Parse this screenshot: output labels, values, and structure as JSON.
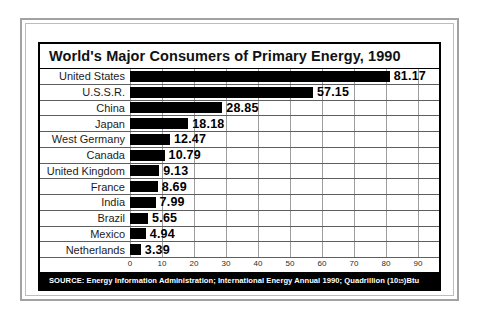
{
  "chart": {
    "title": "World's Major Consumers of Primary Energy, 1990",
    "source_prefix": "SOURCE: Energy Information Administration; International Energy Annual 1990; Quadrillion (10",
    "source_superscript": "15",
    "source_suffix": ")Btu"
  },
  "chart_data": {
    "type": "bar",
    "orientation": "horizontal",
    "title": "World's Major Consumers of Primary Energy, 1990",
    "categories": [
      "United States",
      "U.S.S.R.",
      "China",
      "Japan",
      "West Germany",
      "Canada",
      "United Kingdom",
      "France",
      "India",
      "Brazil",
      "Mexico",
      "Netherlands"
    ],
    "values": [
      81.17,
      57.15,
      28.85,
      18.18,
      12.47,
      10.79,
      9.13,
      8.69,
      7.99,
      5.65,
      4.94,
      3.39
    ],
    "value_labels": [
      "81.17",
      "57.15",
      "28.85",
      "18.18",
      "12.47",
      "10.79",
      "9.13",
      "8.69",
      "7.99",
      "5.65",
      "4.94",
      "3.39"
    ],
    "xlabel": "",
    "ylabel": "",
    "xlim": [
      0,
      90
    ],
    "xticks": [
      0,
      10,
      20,
      30,
      40,
      50,
      60,
      70,
      80,
      90
    ],
    "grid": true,
    "legend": false,
    "bar_color": "#000000",
    "units": "Quadrillion (10^15) Btu",
    "source": "SOURCE: Energy Information Administration; International Energy Annual 1990; Quadrillion (10^15)Btu"
  },
  "colors": {
    "bar": "#000000",
    "frame": "#a2a2a2",
    "grid": "#9d9d9d",
    "row_divider": "#5e5e5e",
    "source_bg": "#000000",
    "source_text": "#ffffff"
  }
}
